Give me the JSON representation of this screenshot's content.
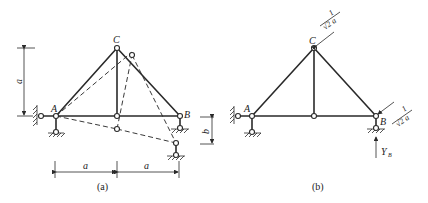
{
  "figure_a": {
    "caption": "(a)",
    "joint_labels": {
      "A": "A",
      "B": "B",
      "C": "C"
    },
    "dimension_height": "a",
    "dimension_settlement": "b",
    "dimension_span_left": "a",
    "dimension_span_right": "a"
  },
  "figure_b": {
    "caption": "(b)",
    "joint_labels": {
      "A": "A",
      "B": "B",
      "C": "C"
    },
    "force_C": {
      "numerator": "1",
      "denominator": "√2 a"
    },
    "force_B": {
      "numerator": "1",
      "denominator": "√2 a"
    },
    "reaction_label": "Y",
    "reaction_subscript": "B"
  },
  "colors": {
    "line": "#2a2a2a",
    "background": "#ffffff"
  }
}
